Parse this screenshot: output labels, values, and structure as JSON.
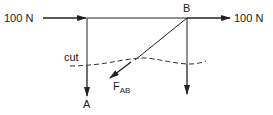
{
  "diagram": {
    "type": "free-body diagram / method of sections",
    "labels": {
      "left_force": "100 N",
      "right_force": "100 N",
      "joint_b": "B",
      "joint_a": "A",
      "cut": "cut",
      "member_force": "F",
      "member_force_sub": "AB"
    },
    "colors": {
      "line": "#222222",
      "background": "#ffffff"
    }
  }
}
